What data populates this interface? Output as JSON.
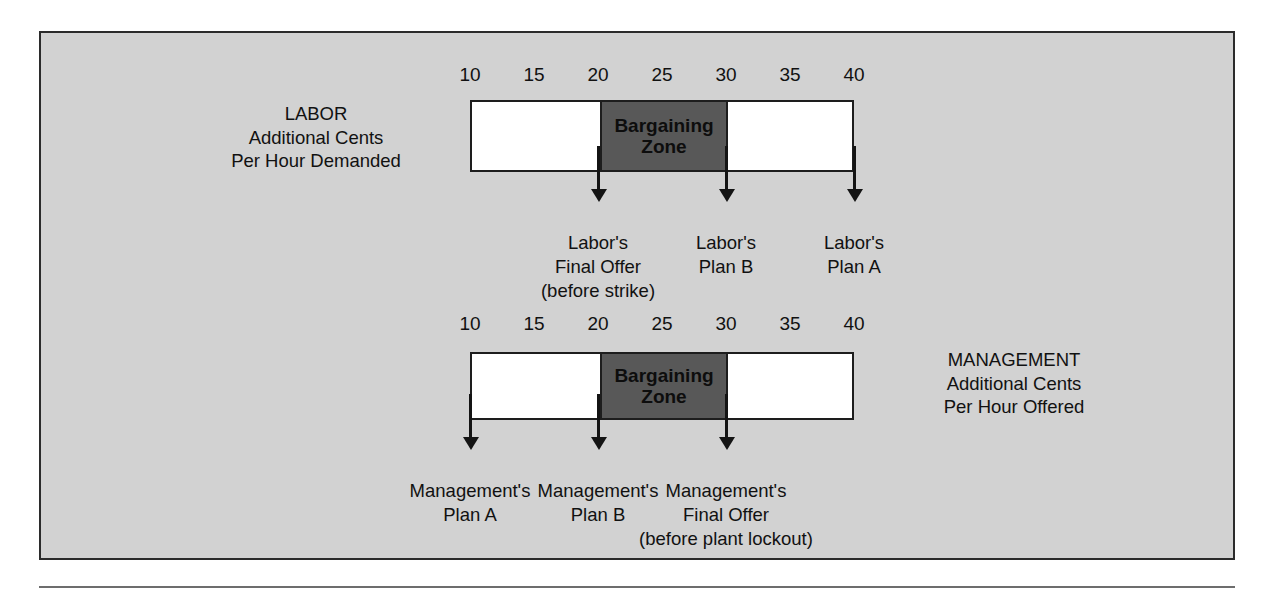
{
  "chart_data": {
    "type": "diagram",
    "axis": {
      "ticks": [
        10,
        15,
        20,
        25,
        30,
        35,
        40
      ],
      "min": 10,
      "max": 40,
      "unit": "additional cents per hour"
    },
    "zone": {
      "label": "Bargaining\nZone",
      "start": 20,
      "end": 30,
      "fill": "#585858"
    },
    "rows": [
      {
        "id": "labor",
        "caption": "LABOR\nAdditional Cents\nPer Hour Demanded",
        "caption_side": "left",
        "markers": [
          {
            "value": 20,
            "label": "Labor's\nFinal Offer\n(before strike)"
          },
          {
            "value": 30,
            "label": "Labor's\nPlan B"
          },
          {
            "value": 40,
            "label": "Labor's\nPlan A"
          }
        ]
      },
      {
        "id": "management",
        "caption": "MANAGEMENT\nAdditional Cents\nPer Hour Offered",
        "caption_side": "right",
        "markers": [
          {
            "value": 10,
            "label": "Management's\nPlan A"
          },
          {
            "value": 20,
            "label": "Management's\nPlan B"
          },
          {
            "value": 30,
            "label": "Management's\nFinal Offer\n(before plant lockout)"
          }
        ]
      }
    ]
  },
  "colors": {
    "background": "#d2d2d2",
    "bar_fill": "#ffffff",
    "zone_fill": "#585858",
    "outline": "#1d1d1d",
    "text": "#111111"
  }
}
